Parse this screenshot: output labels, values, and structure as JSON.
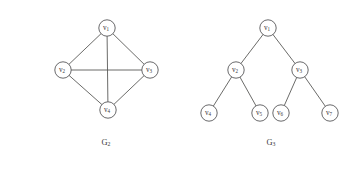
{
  "figure": {
    "background_color": "#ffffff",
    "stroke_color": "#58585a",
    "label_color": "#3a3a3a",
    "node_fill": "#ffffff",
    "node_radius": 8.2
  },
  "chart_data": {
    "type": "diagram",
    "title": "",
    "graphs": [
      {
        "caption_base": "G",
        "caption_sub": "2",
        "caption_x": 106,
        "caption_y": 143,
        "description": "complete graph on four vertices drawn as a diamond with both diagonals",
        "nodes": [
          {
            "id": "v1",
            "base": "v",
            "sub": "1",
            "x": 107,
            "y": 28
          },
          {
            "id": "v2",
            "base": "v",
            "sub": "2",
            "x": 63,
            "y": 70
          },
          {
            "id": "v3",
            "base": "v",
            "sub": "3",
            "x": 150,
            "y": 70
          },
          {
            "id": "v4",
            "base": "v",
            "sub": "4",
            "x": 108,
            "y": 110
          }
        ],
        "edges": [
          {
            "from": "v1",
            "to": "v2"
          },
          {
            "from": "v1",
            "to": "v3"
          },
          {
            "from": "v1",
            "to": "v4"
          },
          {
            "from": "v2",
            "to": "v3"
          },
          {
            "from": "v2",
            "to": "v4"
          },
          {
            "from": "v3",
            "to": "v4"
          }
        ]
      },
      {
        "caption_base": "G",
        "caption_sub": "3",
        "caption_x": 271,
        "caption_y": 143,
        "description": "complete binary tree of depth two with seven vertices",
        "nodes": [
          {
            "id": "v1",
            "base": "v",
            "sub": "1",
            "x": 268,
            "y": 28
          },
          {
            "id": "v2",
            "base": "v",
            "sub": "2",
            "x": 236,
            "y": 70
          },
          {
            "id": "v3",
            "base": "v",
            "sub": "3",
            "x": 300,
            "y": 70
          },
          {
            "id": "v4",
            "base": "v",
            "sub": "4",
            "x": 209,
            "y": 113
          },
          {
            "id": "v5",
            "base": "v",
            "sub": "5",
            "x": 260,
            "y": 113
          },
          {
            "id": "v6",
            "base": "v",
            "sub": "6",
            "x": 281,
            "y": 113
          },
          {
            "id": "v7",
            "base": "v",
            "sub": "7",
            "x": 330,
            "y": 113
          }
        ],
        "edges": [
          {
            "from": "v1",
            "to": "v2"
          },
          {
            "from": "v1",
            "to": "v3"
          },
          {
            "from": "v2",
            "to": "v4"
          },
          {
            "from": "v2",
            "to": "v5"
          },
          {
            "from": "v3",
            "to": "v6"
          },
          {
            "from": "v3",
            "to": "v7"
          }
        ]
      }
    ]
  }
}
